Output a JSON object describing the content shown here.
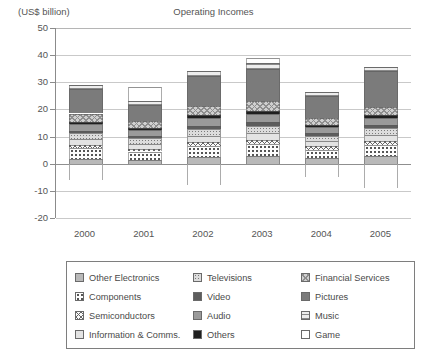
{
  "chart_data": {
    "type": "bar",
    "title": "Operating Incomes",
    "subtitle": "(US$ billion)",
    "xlabel": "",
    "ylabel": "(US$ billion)",
    "ylim": [
      -20,
      50
    ],
    "yticks": [
      50,
      40,
      30,
      20,
      10,
      0,
      -10,
      -20
    ],
    "ytick_labels": [
      "50",
      "40",
      "30",
      "20",
      "10",
      "0",
      "-10",
      "-20"
    ],
    "grid": true,
    "legend_position": "bottom",
    "stacked": true,
    "categories": [
      "2000",
      "2001",
      "2002",
      "2003",
      "2004",
      "2005"
    ],
    "series": [
      {
        "name": "Other Electronics",
        "key": "other-electronics",
        "color": "#b9b9b9",
        "values": [
          1.6,
          1.5,
          2.6,
          2.8,
          2.0,
          3.0
        ]
      },
      {
        "name": "Components",
        "key": "components",
        "color": "#fdfdfd",
        "values": [
          4.2,
          3.0,
          4.0,
          4.5,
          3.2,
          4.0
        ]
      },
      {
        "name": "Semiconductors",
        "key": "semiconductors",
        "color": "#fafafa",
        "values": [
          1.2,
          1.0,
          1.4,
          1.5,
          1.2,
          1.4
        ]
      },
      {
        "name": "Information & Comms.",
        "key": "infocomms",
        "color": "#e3e3e3",
        "values": [
          2.0,
          1.8,
          2.2,
          2.4,
          1.8,
          2.2
        ]
      },
      {
        "name": "Televisions",
        "key": "televisions",
        "color": "#dcdcdc",
        "values": [
          2.2,
          2.0,
          2.6,
          2.8,
          2.0,
          2.4
        ]
      },
      {
        "name": "Video",
        "key": "video",
        "color": "#5d5d5d",
        "values": [
          1.0,
          0.9,
          1.2,
          1.3,
          1.0,
          1.2
        ]
      },
      {
        "name": "Audio",
        "key": "audio",
        "color": "#9a9a9a",
        "values": [
          2.4,
          2.2,
          2.8,
          3.0,
          2.2,
          2.6
        ]
      },
      {
        "name": "Others",
        "key": "others",
        "color": "#1f1f1f",
        "values": [
          0.9,
          0.8,
          1.0,
          1.1,
          0.8,
          1.0
        ]
      },
      {
        "name": "Financial Services",
        "key": "financial",
        "color": "#cfcfcf",
        "values": [
          3.0,
          2.6,
          3.4,
          3.6,
          2.8,
          3.2
        ]
      },
      {
        "name": "Pictures",
        "key": "pictures",
        "color": "#7b7b7b",
        "values": [
          9.0,
          6.0,
          11.0,
          12.0,
          8.0,
          13.0
        ]
      },
      {
        "name": "Music",
        "key": "music",
        "color": "#ededed",
        "values": [
          1.5,
          1.3,
          1.8,
          2.0,
          1.4,
          1.8
        ]
      },
      {
        "name": "Game",
        "key": "game",
        "color": "#ffffff",
        "values": [
          -6.0,
          5.0,
          -8.0,
          2.0,
          -5.0,
          -9.0
        ]
      }
    ],
    "totals": [
      "27.8",
      "23.0",
      "35.5",
      "37.5",
      "24.5",
      "37.0"
    ]
  },
  "axis": {
    "y_labels": [
      "50",
      "40",
      "30",
      "20",
      "10",
      "0",
      "-10",
      "-20"
    ],
    "x_labels": [
      "2000",
      "2001",
      "2002",
      "2003",
      "2004",
      "2005"
    ]
  },
  "legend": {
    "items": [
      {
        "label": "Other Electronics",
        "swatch": "other-electronics"
      },
      {
        "label": "Components",
        "swatch": "components"
      },
      {
        "label": "Semiconductors",
        "swatch": "semiconductors"
      },
      {
        "label": "Information & Comms.",
        "swatch": "infocomms"
      },
      {
        "label": "Televisions",
        "swatch": "televisions"
      },
      {
        "label": "Video",
        "swatch": "video"
      },
      {
        "label": "Audio",
        "swatch": "audio"
      },
      {
        "label": "Others",
        "swatch": "others"
      },
      {
        "label": "Financial Services",
        "swatch": "financial"
      },
      {
        "label": "Pictures",
        "swatch": "pictures"
      },
      {
        "label": "Music",
        "swatch": "music"
      },
      {
        "label": "Game",
        "swatch": "game"
      }
    ]
  }
}
